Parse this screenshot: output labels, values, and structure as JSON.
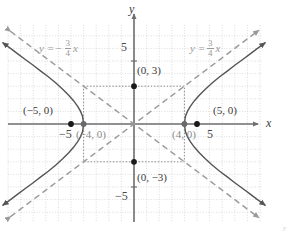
{
  "figure": {
    "type": "hyperbola-graph",
    "corner_mark": "y"
  },
  "axes": {
    "x_label": "x",
    "y_label": "y",
    "x_ticks": [
      {
        "value": -5,
        "label": "−5"
      },
      {
        "value": 5,
        "label": "5"
      }
    ],
    "y_ticks": [
      {
        "value": 5,
        "label": "5"
      },
      {
        "value": -5,
        "label": "−5"
      }
    ],
    "xlim": [
      -9.5,
      10
    ],
    "ylim": [
      -7.5,
      7.5
    ],
    "grid": true
  },
  "colors": {
    "axis": "#6e6e6e",
    "grid": "#d4d4d4",
    "curve": "#555555",
    "asymptote": "#9a9a9a",
    "dotted": "#8a8a8a",
    "point": "#1a1a1a",
    "label": "#3b3b3b",
    "label_gray": "#8b8b8b",
    "background": "#ffffff"
  },
  "asymptotes": [
    {
      "name": "asymptote-negative",
      "slope": -0.75,
      "label_prefix": "y =",
      "label_sign": "−",
      "numerator": "3",
      "denominator": "4",
      "label_suffix": "x"
    },
    {
      "name": "asymptote-positive",
      "slope": 0.75,
      "label_prefix": "y =",
      "label_sign": "",
      "numerator": "3",
      "denominator": "4",
      "label_suffix": "x"
    }
  ],
  "points": [
    {
      "name": "vertex-left",
      "label": "(−4, 0)",
      "x": -4,
      "y": 0,
      "style": "gray",
      "marker": "filled"
    },
    {
      "name": "vertex-right",
      "label": "(4, 0)",
      "x": 4,
      "y": 0,
      "style": "gray",
      "marker": "filled"
    },
    {
      "name": "focus-left",
      "label": "(−5, 0)",
      "x": -5,
      "y": 0,
      "style": "dark",
      "marker": "filled"
    },
    {
      "name": "focus-right",
      "label": "(5, 0)",
      "x": 5,
      "y": 0,
      "style": "dark",
      "marker": "filled"
    },
    {
      "name": "co-vertex-top",
      "label": "(0, 3)",
      "x": 0,
      "y": 3,
      "style": "dark",
      "marker": "filled"
    },
    {
      "name": "co-vertex-bottom",
      "label": "(0, −3)",
      "x": 0,
      "y": -3,
      "style": "dark",
      "marker": "filled"
    }
  ],
  "chart_data": {
    "type": "line",
    "title": "",
    "xlabel": "x",
    "ylabel": "y",
    "xlim": [
      -9.5,
      10
    ],
    "ylim": [
      -7.5,
      7.5
    ],
    "grid": true,
    "legend": "none",
    "equation": "x^2/16 - y^2/9 = 1",
    "series": [
      {
        "name": "hyperbola-right-branch",
        "style": "solid",
        "color": "#555555",
        "points": [
          [
            4,
            0
          ],
          [
            4.08,
            0.6
          ],
          [
            4.24,
            1.0
          ],
          [
            4.47,
            1.4
          ],
          [
            4.8,
            1.85
          ],
          [
            5.2,
            2.3
          ],
          [
            5.66,
            2.76
          ],
          [
            6.2,
            3.25
          ],
          [
            6.8,
            3.75
          ],
          [
            7.4,
            4.2
          ],
          [
            8.0,
            4.66
          ],
          [
            8.6,
            5.1
          ],
          [
            9.2,
            5.55
          ],
          [
            9.8,
            6.0
          ],
          [
            10.4,
            6.44
          ]
        ]
      },
      {
        "name": "hyperbola-right-branch-lower",
        "style": "solid",
        "color": "#555555",
        "points": [
          [
            4,
            0
          ],
          [
            4.08,
            -0.6
          ],
          [
            4.24,
            -1.0
          ],
          [
            4.47,
            -1.4
          ],
          [
            4.8,
            -1.85
          ],
          [
            5.2,
            -2.3
          ],
          [
            5.66,
            -2.76
          ],
          [
            6.2,
            -3.25
          ],
          [
            6.8,
            -3.75
          ],
          [
            7.4,
            -4.2
          ],
          [
            8.0,
            -4.66
          ],
          [
            8.6,
            -5.1
          ],
          [
            9.2,
            -5.55
          ],
          [
            9.8,
            -6.0
          ],
          [
            10.4,
            -6.44
          ]
        ]
      },
      {
        "name": "hyperbola-left-branch-upper",
        "style": "solid",
        "color": "#555555",
        "points": [
          [
            -4,
            0
          ],
          [
            -4.08,
            0.6
          ],
          [
            -4.24,
            1.0
          ],
          [
            -4.47,
            1.4
          ],
          [
            -4.8,
            1.85
          ],
          [
            -5.2,
            2.3
          ],
          [
            -5.66,
            2.76
          ],
          [
            -6.2,
            3.25
          ],
          [
            -6.8,
            3.75
          ],
          [
            -7.4,
            4.2
          ],
          [
            -8.0,
            4.66
          ],
          [
            -8.6,
            5.1
          ],
          [
            -9.2,
            5.55
          ],
          [
            -9.8,
            6.0
          ],
          [
            -10.4,
            6.44
          ]
        ]
      },
      {
        "name": "hyperbola-left-branch-lower",
        "style": "solid",
        "color": "#555555",
        "points": [
          [
            -4,
            0
          ],
          [
            -4.08,
            -0.6
          ],
          [
            -4.24,
            -1.0
          ],
          [
            -4.47,
            -1.4
          ],
          [
            -4.8,
            -1.85
          ],
          [
            -5.2,
            -2.3
          ],
          [
            -5.66,
            -2.76
          ],
          [
            -6.2,
            -3.25
          ],
          [
            -6.8,
            -3.75
          ],
          [
            -7.4,
            -4.2
          ],
          [
            -8.0,
            -4.66
          ],
          [
            -8.6,
            -5.1
          ],
          [
            -9.2,
            -5.55
          ],
          [
            -9.8,
            -6.0
          ],
          [
            -10.4,
            -6.44
          ]
        ]
      },
      {
        "name": "asymptote-positive-slope",
        "style": "dashed",
        "color": "#9a9a9a",
        "points": [
          [
            -9.8,
            -7.35
          ],
          [
            9.9,
            7.43
          ]
        ]
      },
      {
        "name": "asymptote-negative-slope",
        "style": "dashed",
        "color": "#9a9a9a",
        "points": [
          [
            -9.8,
            7.35
          ],
          [
            9.9,
            -7.43
          ]
        ]
      },
      {
        "name": "reference-rectangle",
        "style": "dotted",
        "color": "#8a8a8a",
        "points": [
          [
            -4,
            3
          ],
          [
            4,
            3
          ],
          [
            4,
            -3
          ],
          [
            -4,
            -3
          ],
          [
            -4,
            3
          ]
        ]
      }
    ],
    "markers": [
      {
        "label": "(−5, 0)",
        "x": -5,
        "y": 0
      },
      {
        "label": "(−4, 0)",
        "x": -4,
        "y": 0
      },
      {
        "label": "(4, 0)",
        "x": 4,
        "y": 0
      },
      {
        "label": "(5, 0)",
        "x": 5,
        "y": 0
      },
      {
        "label": "(0, 3)",
        "x": 0,
        "y": 3
      },
      {
        "label": "(0, −3)",
        "x": 0,
        "y": -3
      }
    ],
    "annotations": [
      {
        "text": "y = -3/4 x",
        "x": -6.2,
        "y": 5.6
      },
      {
        "text": "y = 3/4 x",
        "x": 5.2,
        "y": 5.6
      }
    ]
  }
}
